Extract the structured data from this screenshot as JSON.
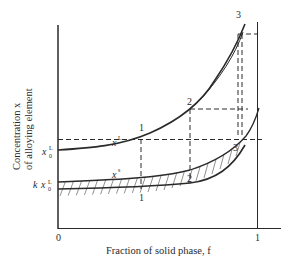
{
  "figure": {
    "y_axis_label_line1": "Concentration  x",
    "y_axis_label_line2": "of alloying element",
    "x_axis_label": "Fraction of solid phase, f",
    "x_tick_0": "0",
    "x_tick_1": "1",
    "y_tick_liquid_main": "x",
    "y_tick_liquid_sub": "0",
    "y_tick_liquid_sup": "L",
    "y_tick_solid_prefix": "k",
    "y_tick_solid_main": "x",
    "y_tick_solid_sub": "0",
    "y_tick_solid_sup": "L",
    "curve_liquid_label": "x",
    "curve_liquid_sup": "L",
    "curve_solid_label": "x",
    "curve_solid_sup": "s",
    "points_liquid": [
      "1",
      "2",
      "3"
    ],
    "points_solid": [
      "1",
      "2",
      "3"
    ]
  },
  "colors": {
    "ink": "#2a2a2a",
    "background": "#ffffff"
  }
}
